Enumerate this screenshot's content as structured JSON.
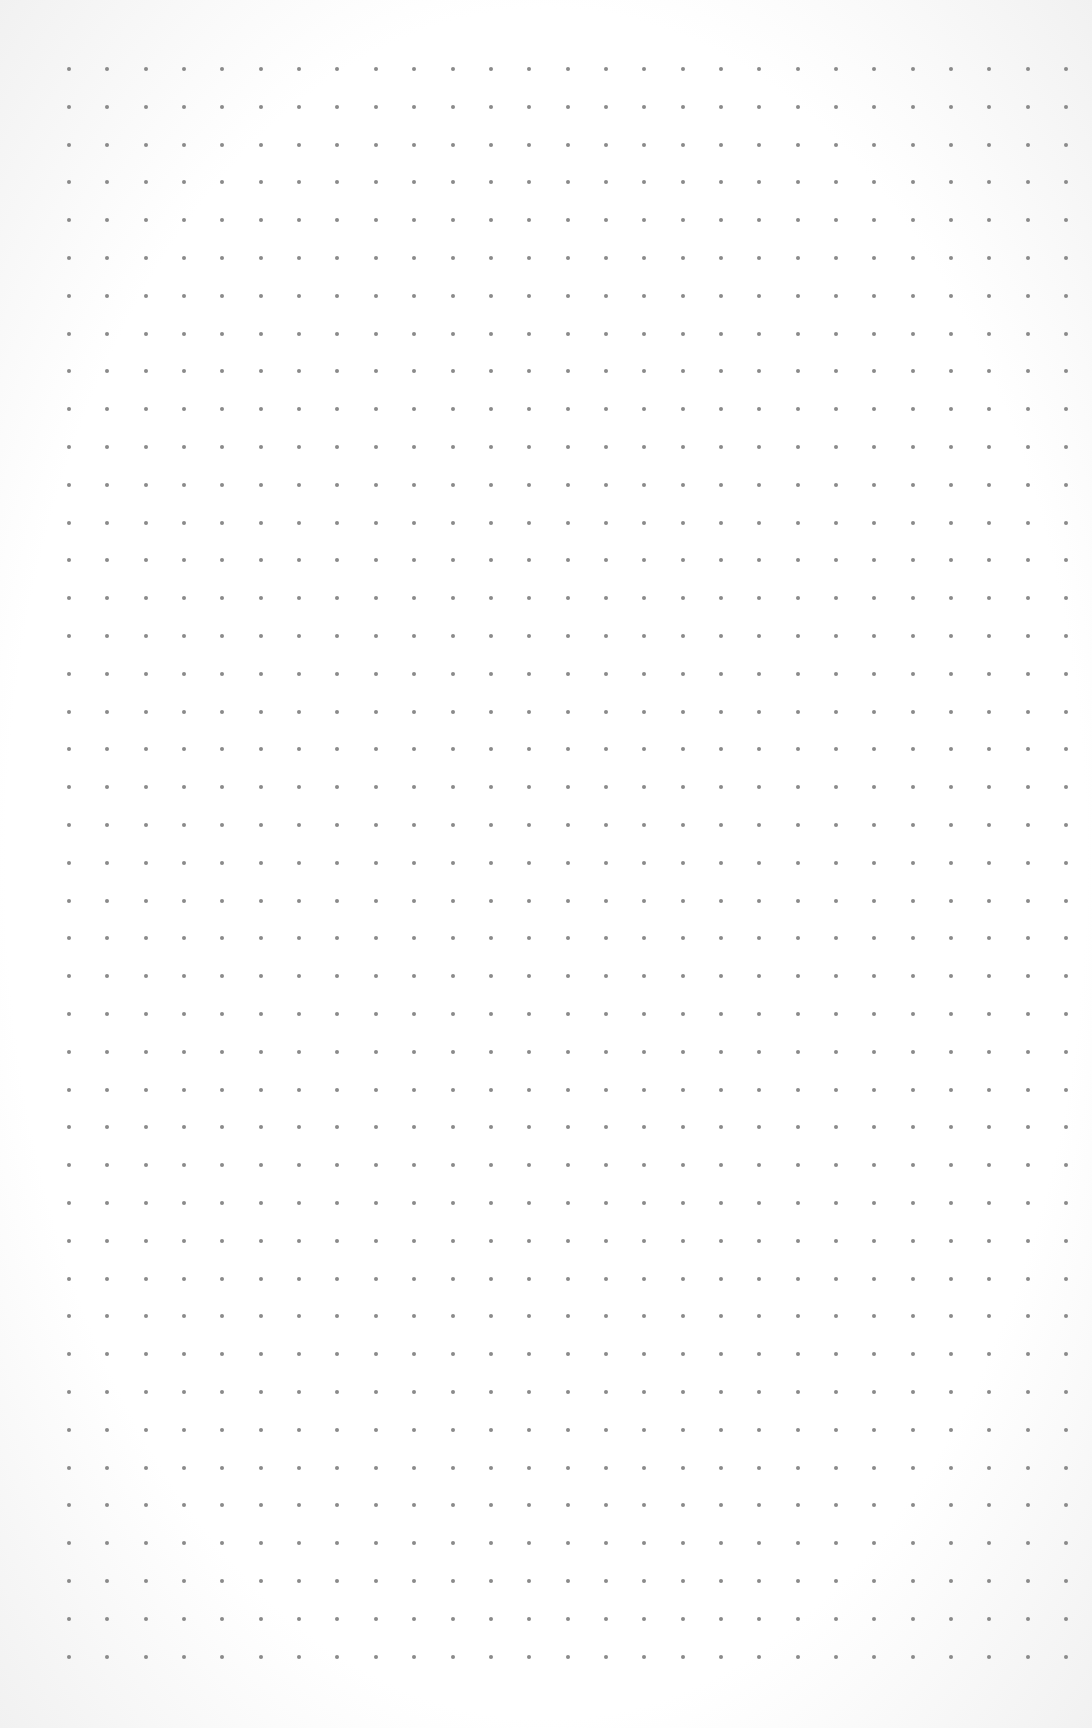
{
  "page": {
    "type": "dot-grid-paper",
    "background_color": "#fdfdfd",
    "dot_color": "#8a8a8a",
    "dot_size_px": 4
  },
  "grid": {
    "columns": 27,
    "rows": 43,
    "origin_x": 69,
    "origin_y": 69,
    "spacing_x": 38.35,
    "spacing_y": 37.8
  }
}
